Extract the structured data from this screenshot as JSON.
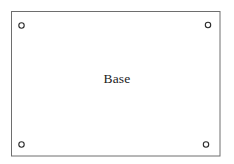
{
  "drawing": {
    "title": "Base",
    "canvas": {
      "width": 234,
      "height": 164,
      "background_color": "#ffffff"
    },
    "plate": {
      "label": "Base",
      "shape": "rectangle",
      "x": 11,
      "y": 11,
      "width": 209,
      "height": 145,
      "stroke_color": "#6e6e6e",
      "stroke_width": 1,
      "fill_color": "#ffffff"
    },
    "holes": [
      {
        "name": "hole-top-left",
        "cx": 21.5,
        "cy": 25.5,
        "r": 2.8,
        "stroke_color": "#2b2b2b"
      },
      {
        "name": "hole-top-right",
        "cx": 208,
        "cy": 25,
        "r": 2.8,
        "stroke_color": "#2b2b2b"
      },
      {
        "name": "hole-bottom-left",
        "cx": 21.5,
        "cy": 144.5,
        "r": 2.8,
        "stroke_color": "#2b2b2b"
      },
      {
        "name": "hole-bottom-right",
        "cx": 206,
        "cy": 144.5,
        "r": 2.8,
        "stroke_color": "#2b2b2b"
      }
    ]
  }
}
